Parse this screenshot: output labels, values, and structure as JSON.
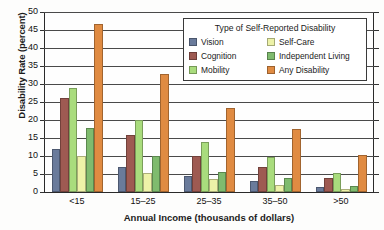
{
  "chart_data": {
    "type": "bar",
    "title": "",
    "xlabel": "Annual Income (thousands of dollars)",
    "ylabel": "Disability Rate (percent)",
    "categories": [
      "<15",
      "15–25",
      "25–35",
      "35–50",
      ">50"
    ],
    "ylim": [
      0,
      50
    ],
    "yticks": [
      0,
      5,
      10,
      15,
      20,
      25,
      30,
      35,
      40,
      45,
      50
    ],
    "grid": true,
    "legend_position": "top-right-inside",
    "legend_title": "Type of Self-Reported Disability",
    "series": [
      {
        "name": "Vision",
        "color": "#6a7b9b",
        "values": [
          12.0,
          7.0,
          4.4,
          3.0,
          1.4
        ]
      },
      {
        "name": "Cognition",
        "color": "#9e5a52",
        "values": [
          26.0,
          15.8,
          10.0,
          7.0,
          4.0
        ]
      },
      {
        "name": "Mobility",
        "color": "#a9dc7d",
        "values": [
          28.9,
          20.0,
          13.8,
          9.8,
          5.4
        ]
      },
      {
        "name": "Self-Care",
        "color": "#edf2a8",
        "values": [
          10.0,
          5.3,
          3.6,
          2.0,
          0.9
        ]
      },
      {
        "name": "Independent Living",
        "color": "#7fbb6e",
        "values": [
          17.9,
          10.0,
          5.6,
          3.9,
          1.7
        ]
      },
      {
        "name": "Any Disability",
        "color": "#e08b42",
        "values": [
          46.8,
          32.9,
          23.3,
          17.5,
          10.3
        ]
      }
    ]
  }
}
